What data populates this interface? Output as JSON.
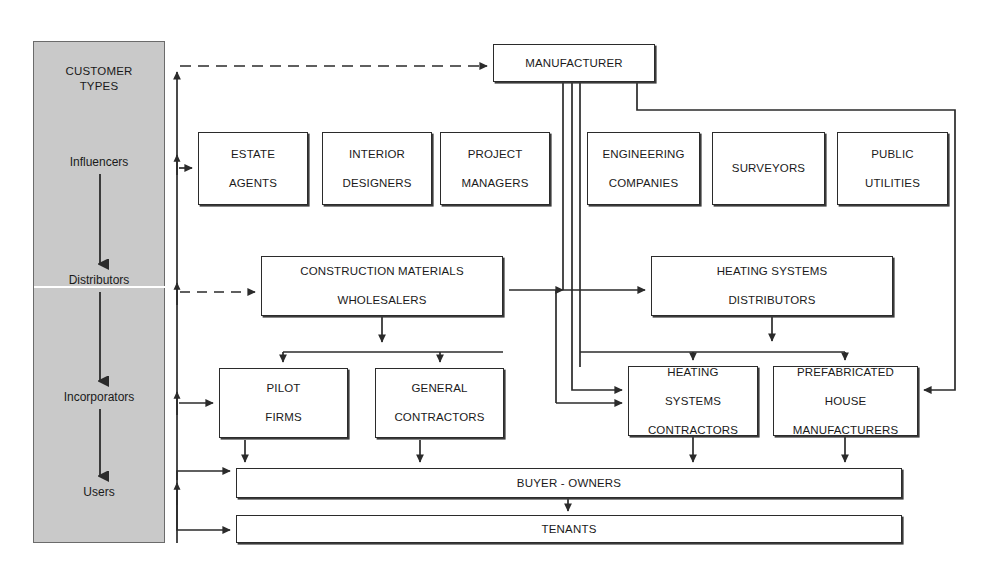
{
  "diagram": {
    "sidebar": {
      "title_line1": "CUSTOMER",
      "title_line2": "TYPES",
      "stages": [
        {
          "label": "Influencers"
        },
        {
          "label": "Distributors"
        },
        {
          "label": "Incorporators"
        },
        {
          "label": "Users"
        }
      ]
    },
    "nodes": {
      "manufacturer": {
        "label": "MANUFACTURER"
      },
      "influencers": [
        {
          "line1": "ESTATE",
          "line2": "AGENTS"
        },
        {
          "line1": "INTERIOR",
          "line2": "DESIGNERS"
        },
        {
          "line1": "PROJECT",
          "line2": "MANAGERS"
        },
        {
          "line1": "ENGINEERING",
          "line2": "COMPANIES"
        },
        {
          "line1": "SURVEYORS",
          "line2": ""
        },
        {
          "line1": "PUBLIC",
          "line2": "UTILITIES"
        }
      ],
      "distributors": [
        {
          "line1": "CONSTRUCTION MATERIALS",
          "line2": "WHOLESALERS"
        },
        {
          "line1": "HEATING SYSTEMS",
          "line2": "DISTRIBUTORS"
        }
      ],
      "incorporators": [
        {
          "line1": "PILOT",
          "line2": "FIRMS",
          "line3": ""
        },
        {
          "line1": "GENERAL",
          "line2": "CONTRACTORS",
          "line3": ""
        },
        {
          "line1": "HEATING",
          "line2": "SYSTEMS",
          "line3": "CONTRACTORS"
        },
        {
          "line1": "PREFABRICATED",
          "line2": "HOUSE",
          "line3": "MANUFACTURERS"
        }
      ],
      "users": [
        {
          "label": "BUYER - OWNERS"
        },
        {
          "label": "TENANTS"
        }
      ]
    },
    "colors": {
      "sidebar_fill": "#c9c9c9",
      "stroke": "#2b2b2b",
      "page_bg": "#ffffff",
      "text": "#1a1a1a"
    }
  }
}
